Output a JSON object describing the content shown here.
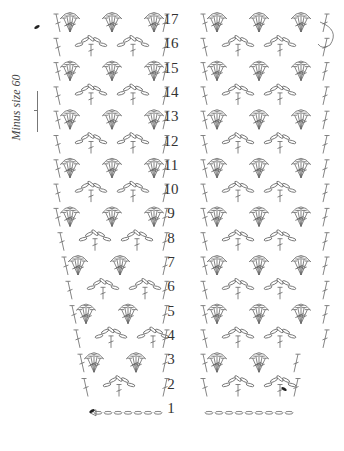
{
  "diagram": {
    "side_note": "Minus size 60",
    "rows": [
      "17",
      "16",
      "15",
      "14",
      "13",
      "12",
      "11",
      "10",
      "9",
      "8",
      "7",
      "6",
      "5",
      "4",
      "3",
      "2",
      "1"
    ],
    "row_label_x": 171,
    "row_top_y": 10,
    "row_spacing": 24.3,
    "stroke_color": "#666666",
    "marker_color": "#222222",
    "left_panel": {
      "x_start": 58,
      "x_end": 165,
      "bottom_narrow_x": 90,
      "narrow_from_row": 8
    },
    "right_panel": {
      "x_start": 205,
      "x_end": 325,
      "bottom_narrow_x": 296,
      "narrow_from_row": 3
    },
    "start_marker": "triangle-icon",
    "end_markers": [
      "filled-oval-left-row-17",
      "filled-oval-left-row-2",
      "filled-oval-right-row-2"
    ]
  }
}
